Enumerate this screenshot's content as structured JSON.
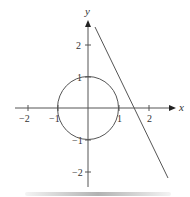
{
  "axes": {
    "x_label": "x",
    "y_label": "y",
    "x_ticks": [
      {
        "value": -2,
        "label": "−2"
      },
      {
        "value": -1,
        "label": "−1"
      },
      {
        "value": 1,
        "label": "1"
      },
      {
        "value": 2,
        "label": "2"
      }
    ],
    "y_ticks": [
      {
        "value": 2,
        "label": "2"
      },
      {
        "value": 1,
        "label": "1"
      },
      {
        "value": -1,
        "label": "−1"
      },
      {
        "value": -2,
        "label": "−2"
      }
    ]
  },
  "shapes": {
    "circle": {
      "center": [
        0,
        0
      ],
      "radius": 1
    },
    "line": {
      "from": [
        0.23,
        2.6
      ],
      "to": [
        2.65,
        -2.25
      ]
    }
  },
  "colors": {
    "stroke": "#555555",
    "text": "#333333"
  }
}
